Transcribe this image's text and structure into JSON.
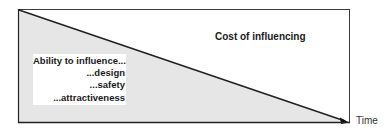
{
  "diagram": {
    "region_below_line_label_lines": [
      "Ability to influence...",
      "...design",
      "...safety",
      "...attractiveness"
    ],
    "region_above_line_label": "Cost of influencing",
    "x_axis_label": "Time",
    "colors": {
      "fill_below_line": "#e6e6e6",
      "line": "#222222",
      "frame": "#333333",
      "background": "#ffffff"
    }
  }
}
